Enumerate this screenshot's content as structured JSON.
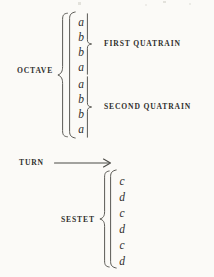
{
  "diagram": {
    "ink_color": "#2f2f2d",
    "paper_color": "#fbfaf7",
    "octave": {
      "label": "OCTAVE",
      "rhymes": [
        "a",
        "b",
        "b",
        "a",
        "a",
        "b",
        "b",
        "a"
      ],
      "groups": [
        {
          "label": "FIRST QUATRAIN",
          "rhymes": [
            "a",
            "b",
            "b",
            "a"
          ]
        },
        {
          "label": "SECOND QUATRAIN",
          "rhymes": [
            "a",
            "b",
            "b",
            "a"
          ]
        }
      ]
    },
    "turn": {
      "label": "TURN",
      "arrow": "right-arrow"
    },
    "sestet": {
      "label": "SESTET",
      "rhymes": [
        "c",
        "d",
        "c",
        "d",
        "c",
        "d"
      ]
    }
  }
}
